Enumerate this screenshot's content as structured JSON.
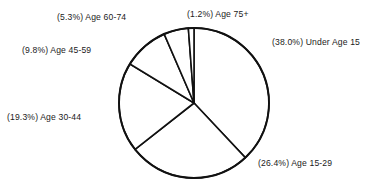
{
  "chart_data": {
    "type": "pie",
    "title": "",
    "xlabel": "",
    "ylabel": "",
    "legend_position": "none",
    "grid": false,
    "center": [
      194,
      103
    ],
    "radius": 75,
    "start_angle_deg": 0,
    "direction": "clockwise",
    "categories": [
      "Under Age 15",
      "Age 15-29",
      "Age 30-44",
      "Age 45-59",
      "Age 60-74",
      "Age 75+"
    ],
    "values": [
      38.0,
      26.4,
      19.3,
      9.8,
      5.3,
      1.2
    ],
    "value_unit": "%",
    "labels": [
      "(38.0%) Under Age 15",
      "(26.4%) Age 15-29",
      "(19.3%) Age 30-44",
      "(9.8%) Age 45-59",
      "(5.3%) Age 60-74",
      "(1.2%) Age 75+"
    ],
    "colors": {
      "slice_fill": "#ffffff",
      "slice_stroke": "#111111",
      "text": "#1b1b1b",
      "background": "#ffffff"
    }
  },
  "labels": {
    "under_15": "(38.0%) Under Age 15",
    "age_15_29": "(26.4%) Age 15-29",
    "age_30_44": "(19.3%) Age 30-44",
    "age_45_59": "(9.8%) Age 45-59",
    "age_60_74": "(5.3%) Age 60-74",
    "age_75_plus": "(1.2%) Age 75+"
  }
}
